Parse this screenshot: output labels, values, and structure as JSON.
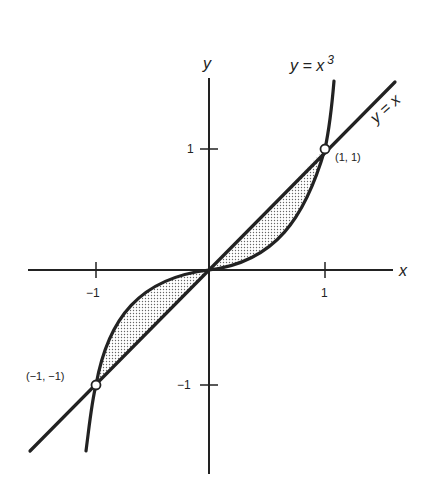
{
  "figure": {
    "axes": {
      "x_label": "x",
      "y_label": "y"
    },
    "ticks": {
      "x_pos": "1",
      "x_neg": "−1",
      "y_pos": "1",
      "y_neg": "−1"
    },
    "curves": {
      "cubic_label": "y = x",
      "cubic_exp": "3",
      "line_label": "y = x"
    },
    "points": {
      "upper": "(1, 1)",
      "lower": "(−1, −1)"
    },
    "colors": {
      "ink": "#222222",
      "shade": "#bdbdbd",
      "background": "#ffffff"
    }
  }
}
